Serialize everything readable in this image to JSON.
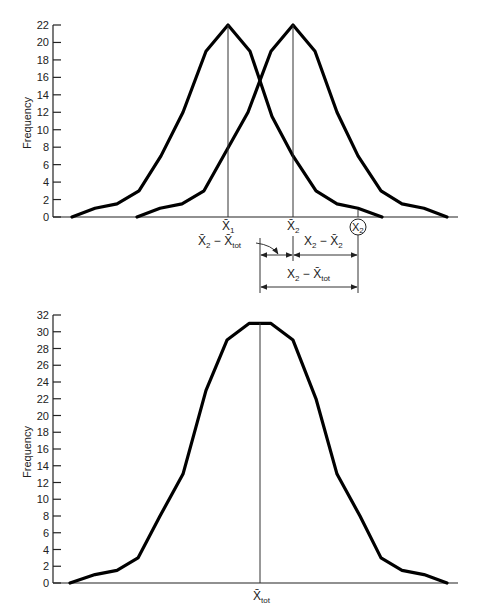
{
  "chart_data": [
    {
      "type": "line",
      "title": "",
      "xlabel": "",
      "ylabel": "Frequency",
      "ylim": [
        0,
        22
      ],
      "yticks": [
        0,
        2,
        4,
        6,
        8,
        10,
        12,
        14,
        16,
        18,
        20,
        22
      ],
      "grid": false,
      "series": [
        {
          "name": "Group 1",
          "x_px": [
            72,
            95,
            117,
            139,
            161,
            183,
            206,
            228,
            250,
            272,
            293,
            316,
            337,
            358,
            382
          ],
          "values": [
            0,
            1,
            1.5,
            3,
            7,
            12,
            19,
            22,
            19,
            11.5,
            7,
            3,
            1.5,
            1,
            0
          ]
        },
        {
          "name": "Group 2",
          "x_px": [
            137,
            160,
            182,
            204,
            226,
            248,
            271,
            293,
            315,
            337,
            358,
            381,
            402,
            424,
            447
          ],
          "values": [
            0,
            1,
            1.5,
            3,
            7.5,
            12,
            19,
            22,
            19,
            12,
            7,
            3,
            1.5,
            1,
            0
          ]
        }
      ],
      "annotations": {
        "mean1_label": "X̄",
        "mean1_sub": "1",
        "mean2_label": "X̄",
        "mean2_sub": "2",
        "score_label": "X",
        "score_sub": "2",
        "between_label": {
          "a": "X̄",
          "a_sub": "2",
          "op": " − ",
          "b": "X̄",
          "b_sub": "tot"
        },
        "within_label": {
          "a": "X",
          "a_sub": "2",
          "op": " − ",
          "b": "X̄",
          "b_sub": "2"
        },
        "total_label": {
          "a": "X",
          "a_sub": "2",
          "op": " − ",
          "b": "X̄",
          "b_sub": "tot"
        }
      }
    },
    {
      "type": "line",
      "title": "",
      "xlabel": "",
      "ylabel": "Frequency",
      "ylim": [
        0,
        32
      ],
      "yticks": [
        0,
        2,
        4,
        6,
        8,
        10,
        12,
        14,
        16,
        18,
        20,
        22,
        24,
        26,
        28,
        30,
        32
      ],
      "grid": false,
      "series": [
        {
          "name": "Combined",
          "x_px": [
            70,
            95,
            117,
            138,
            160,
            183,
            206,
            227,
            249,
            271,
            293,
            316,
            337,
            360,
            381,
            402,
            424,
            447
          ],
          "values": [
            0,
            1,
            1.5,
            3,
            8,
            13,
            23,
            29,
            31,
            31,
            29,
            22,
            13,
            8,
            3,
            1.5,
            1,
            0
          ]
        }
      ],
      "annotations": {
        "grand_mean_label": "X̄",
        "grand_mean_sub": "tot"
      }
    }
  ]
}
